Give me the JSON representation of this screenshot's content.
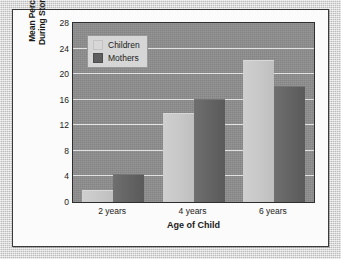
{
  "chart_data": {
    "type": "bar",
    "title": "",
    "xlabel": "Age of Child",
    "ylabel": "Mean Percentage of Utterances During Storybook Conversations",
    "ylabel_line1": "Mean Percentage of Utterances",
    "ylabel_line2": "During Storybook Conversations",
    "categories": [
      "2 years",
      "4 years",
      "6 years"
    ],
    "series": [
      {
        "name": "Children",
        "values": [
          1.7,
          13.7,
          22.0
        ],
        "color": "#c9c9c9"
      },
      {
        "name": "Mothers",
        "values": [
          4.2,
          16.0,
          18.0
        ],
        "color": "#626262"
      }
    ],
    "ylim": [
      0,
      28
    ],
    "ytick_step": 4,
    "yticks": [
      0,
      4,
      8,
      12,
      16,
      20,
      24,
      28
    ],
    "ytick_labels": [
      "0",
      "4",
      "8",
      "12",
      "16",
      "20",
      "24",
      "28"
    ],
    "grid": "horizontal",
    "legend_position": "top-left-inside",
    "plot_background": "#8d8d8d",
    "gridline_color": "#e9e9e9",
    "axis_color": "#2e2e2e",
    "figure_background": "#fbfbfb",
    "mount_background": "#d2d2d2"
  }
}
